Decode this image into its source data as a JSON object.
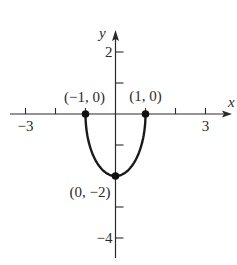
{
  "chart_data": {
    "type": "line",
    "title": "",
    "xlabel": "x",
    "ylabel": "y",
    "xlim": [
      -3.5,
      3.9
    ],
    "ylim": [
      -4.7,
      2.7
    ],
    "x_ticks": [
      -3,
      -2,
      -1,
      1,
      2,
      3
    ],
    "x_tick_labels": [
      {
        "value": -3,
        "label": "−3"
      },
      {
        "value": 3,
        "label": "3"
      }
    ],
    "y_ticks": [
      2,
      1,
      -1,
      -3,
      -4
    ],
    "y_tick_labels": [
      {
        "value": 2,
        "label": "2"
      },
      {
        "value": -4,
        "label": "−4"
      }
    ],
    "grid": false,
    "series": [
      {
        "name": "curve",
        "description": "lower half of ellipse x^2 + y^2/4 = 1",
        "domain": [
          -1,
          1
        ],
        "color": "#1a1a1a"
      }
    ],
    "points": [
      {
        "x": -1,
        "y": 0,
        "label": "(−1, 0)"
      },
      {
        "x": 1,
        "y": 0,
        "label": "(1, 0)"
      },
      {
        "x": 0,
        "y": -2,
        "label": "(0, −2)"
      }
    ]
  }
}
